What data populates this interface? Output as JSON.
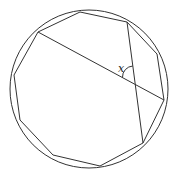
{
  "diagram": {
    "polygon": {
      "sides": 10,
      "vertex_labels": []
    },
    "angle_label": "x",
    "colors": {
      "line": "#333333",
      "background": "#ffffff"
    }
  }
}
